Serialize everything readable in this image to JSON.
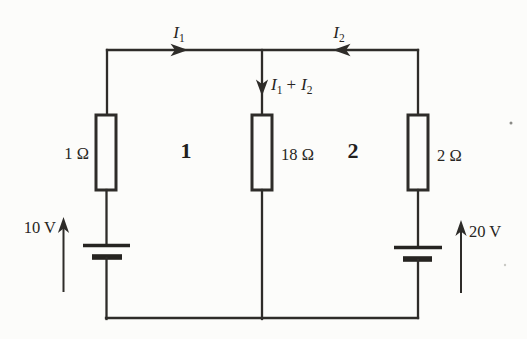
{
  "figure": {
    "type": "circuit-diagram",
    "background_color": "#fcfcfa",
    "line_color": "#2e2c29"
  },
  "currents": {
    "i1": {
      "symbol": "I",
      "subscript": "1"
    },
    "i2": {
      "symbol": "I",
      "subscript": "2"
    },
    "sum": {
      "symbol_a": "I",
      "subscript_a": "1",
      "operator": "+",
      "symbol_b": "I",
      "subscript_b": "2"
    }
  },
  "resistors": {
    "left": "1 Ω",
    "middle": "18 Ω",
    "right": "2 Ω"
  },
  "sources": {
    "left": "10 V",
    "right": "20 V"
  },
  "loops": {
    "left": "1",
    "right": "2"
  }
}
